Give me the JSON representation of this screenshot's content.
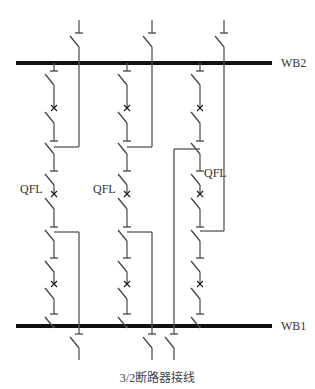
{
  "diagram": {
    "title": "3/2断路器接线",
    "buses": [
      {
        "id": "WB2",
        "label": "WB2",
        "y": 63,
        "x1": 16,
        "x2": 272
      },
      {
        "id": "WB1",
        "label": "WB1",
        "y": 326,
        "x1": 16,
        "x2": 272
      }
    ],
    "breaker_label": "QFL",
    "strings": [
      {
        "x": 54,
        "qfl_label": "QFL",
        "qfl_label_pos": "left"
      },
      {
        "x": 127,
        "qfl_label": "QFL",
        "qfl_label_pos": "left"
      },
      {
        "x": 200,
        "qfl_label": "QFL",
        "qfl_label_pos": "right"
      }
    ],
    "feeders": [
      {
        "string": 1,
        "side": "top",
        "x": 79,
        "tap_y": 147
      },
      {
        "string": 1,
        "side": "bottom",
        "x": 79,
        "tap_y": 232
      },
      {
        "string": 2,
        "side": "top",
        "x": 152,
        "tap_y": 147
      },
      {
        "string": 2,
        "side": "bottom",
        "x": 152,
        "tap_y": 232
      },
      {
        "string": 3,
        "side": "top",
        "x": 224,
        "tap_y": 231
      },
      {
        "string": 3,
        "side": "bottom",
        "x": 174,
        "tap_y": 149
      }
    ],
    "elements": {
      "disconnector": "disconnector-switch",
      "circuit_breaker": "circuit-breaker-x"
    }
  }
}
